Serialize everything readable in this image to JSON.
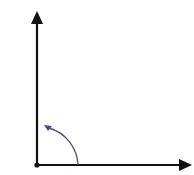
{
  "diagram": {
    "type": "angle-rotation",
    "colors": {
      "axes": "#111111",
      "arc": "#4a4a8a",
      "background": "#ffffff"
    },
    "origin": {
      "x": 37,
      "y": 165
    },
    "vertical_axis": {
      "x": 37,
      "y_start": 165,
      "y_end": 12
    },
    "horizontal_axis": {
      "y": 165,
      "x_start": 37,
      "x_end": 192
    },
    "arc": {
      "start": {
        "x": 78,
        "y": 165
      },
      "end": {
        "x": 45,
        "y": 126
      },
      "direction": "counter-clockwise"
    }
  }
}
